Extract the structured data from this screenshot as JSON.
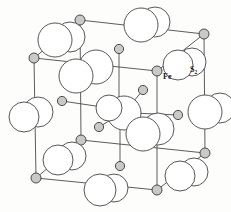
{
  "figure": {
    "background_color": "#fdfdfc",
    "line_color": "#4a4a4a",
    "sphere_large_fill": "#ffffff",
    "sphere_large_stroke": "#444444",
    "sphere_small_fill": "#c9c9c9",
    "sphere_small_stroke": "#3a3a3a"
  },
  "labels": [
    {
      "id": "fe-label",
      "text": "Fe",
      "sub": "",
      "x": 163,
      "y": 79
    },
    {
      "id": "s2-label",
      "text": "S",
      "sub": "2",
      "x": 190,
      "y": 72
    }
  ],
  "chart_data": {
    "type": "diagram",
    "legend": [
      "Fe",
      "S2"
    ],
    "cube_vertices": {
      "front_top_left": [
        34,
        58
      ],
      "front_top_right": [
        157,
        71
      ],
      "front_bottom_left": [
        36,
        178
      ],
      "front_bottom_right": [
        157,
        190
      ],
      "back_top_left": [
        80,
        20
      ],
      "back_top_right": [
        204,
        34
      ],
      "back_bottom_left": [
        81,
        140
      ],
      "back_bottom_right": [
        205,
        153
      ]
    },
    "cube_edges": [
      [
        "front_top_left",
        "front_top_right"
      ],
      [
        "front_top_right",
        "front_bottom_right"
      ],
      [
        "front_bottom_right",
        "front_bottom_left"
      ],
      [
        "front_bottom_left",
        "front_top_left"
      ],
      [
        "back_top_left",
        "back_top_right"
      ],
      [
        "back_top_right",
        "back_bottom_right"
      ],
      [
        "back_bottom_right",
        "back_bottom_left"
      ],
      [
        "back_bottom_left",
        "back_top_left"
      ],
      [
        "front_top_left",
        "back_top_left"
      ],
      [
        "front_top_right",
        "back_top_right"
      ],
      [
        "front_bottom_left",
        "back_bottom_left"
      ],
      [
        "front_bottom_right",
        "back_bottom_right"
      ]
    ],
    "fe_atoms": [
      {
        "x": 34,
        "y": 58,
        "r": 5.0,
        "name": "fe-corner-front-top-left"
      },
      {
        "x": 157,
        "y": 71,
        "r": 5.0,
        "name": "fe-corner-front-top-right"
      },
      {
        "x": 36,
        "y": 178,
        "r": 5.0,
        "name": "fe-corner-front-bottom-left"
      },
      {
        "x": 157,
        "y": 190,
        "r": 5.0,
        "name": "fe-corner-front-bottom-right"
      },
      {
        "x": 80,
        "y": 20,
        "r": 5.0,
        "name": "fe-corner-back-top-left"
      },
      {
        "x": 204,
        "y": 34,
        "r": 5.0,
        "name": "fe-corner-back-top-right"
      },
      {
        "x": 81,
        "y": 140,
        "r": 5.0,
        "name": "fe-corner-back-bottom-left"
      },
      {
        "x": 205,
        "y": 153,
        "r": 5.0,
        "name": "fe-corner-back-bottom-right"
      },
      {
        "x": 119,
        "y": 49,
        "r": 4.6,
        "name": "fe-edge-top-mid"
      },
      {
        "x": 120,
        "y": 166,
        "r": 4.6,
        "name": "fe-edge-bottom-mid"
      },
      {
        "x": 62,
        "y": 101,
        "r": 4.6,
        "name": "fe-edge-left-mid"
      },
      {
        "x": 178,
        "y": 115,
        "r": 4.6,
        "name": "fe-edge-right-mid"
      },
      {
        "x": 143,
        "y": 90,
        "r": 4.6,
        "name": "fe-inner-upper-right"
      },
      {
        "x": 99,
        "y": 127,
        "r": 4.6,
        "name": "fe-inner-lower-left"
      }
    ],
    "s2_pairs": [
      {
        "cx1": 55,
        "cy1": 40,
        "r1": 17,
        "cx2": 70,
        "cy2": 37,
        "r2": 15,
        "name": "s2-pair-upper-left"
      },
      {
        "cx1": 141,
        "cy1": 25,
        "r1": 17,
        "cx2": 155,
        "cy2": 22,
        "r2": 15,
        "name": "s2-pair-upper-mid"
      },
      {
        "cx1": 178,
        "cy1": 65,
        "r1": 15,
        "cx2": 192,
        "cy2": 62,
        "r2": 14,
        "name": "s2-pair-upper-right"
      },
      {
        "cx1": 76,
        "cy1": 76,
        "r1": 17,
        "cx2": 96,
        "cy2": 67,
        "r2": 17,
        "name": "s2-pair-mid-left-back"
      },
      {
        "cx1": 205,
        "cy1": 112,
        "r1": 17,
        "cx2": 220,
        "cy2": 108,
        "r2": 15,
        "name": "s2-pair-right-edge"
      },
      {
        "cx1": 24,
        "cy1": 117,
        "r1": 15,
        "cx2": 38,
        "cy2": 112,
        "r2": 15,
        "name": "s2-pair-left-edge"
      },
      {
        "cx1": 109,
        "cy1": 108,
        "r1": 13,
        "cx2": 124,
        "cy2": 113,
        "r2": 17,
        "name": "s2-pair-center"
      },
      {
        "cx1": 143,
        "cy1": 134,
        "r1": 17,
        "cx2": 158,
        "cy2": 129,
        "r2": 16,
        "name": "s2-pair-center-lower-right"
      },
      {
        "cx1": 58,
        "cy1": 160,
        "r1": 15,
        "cx2": 72,
        "cy2": 156,
        "r2": 14,
        "name": "s2-pair-lower-left"
      },
      {
        "cx1": 100,
        "cy1": 190,
        "r1": 16,
        "cx2": 114,
        "cy2": 188,
        "r2": 14,
        "name": "s2-pair-bottom-mid"
      },
      {
        "cx1": 180,
        "cy1": 176,
        "r1": 15,
        "cx2": 194,
        "cy2": 172,
        "r2": 14,
        "name": "s2-pair-lower-right"
      }
    ],
    "bonds": [
      {
        "x1": 143,
        "y1": 90,
        "x2": 124,
        "y2": 113,
        "name": "bond-center-upper-right"
      },
      {
        "x1": 99,
        "y1": 127,
        "x2": 117,
        "y2": 116,
        "name": "bond-center-lower-left"
      },
      {
        "x1": 62,
        "y1": 101,
        "x2": 109,
        "y2": 108,
        "name": "bond-center-left"
      },
      {
        "x1": 178,
        "y1": 115,
        "x2": 133,
        "y2": 113,
        "name": "bond-center-right"
      },
      {
        "x1": 119,
        "y1": 49,
        "x2": 119,
        "y2": 113,
        "name": "bond-center-vertical-up"
      },
      {
        "x1": 120,
        "y1": 166,
        "x2": 120,
        "y2": 118,
        "name": "bond-center-vertical-down"
      }
    ]
  }
}
